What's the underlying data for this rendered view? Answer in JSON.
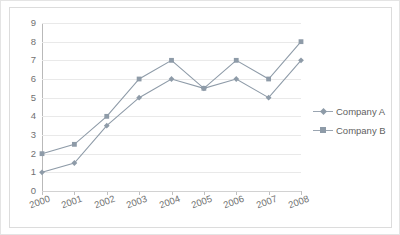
{
  "chart_data": {
    "type": "line",
    "title": "",
    "xlabel": "",
    "ylabel": "",
    "categories": [
      "2000",
      "2001",
      "2002",
      "2003",
      "2004",
      "2005",
      "2006",
      "2007",
      "2008"
    ],
    "series": [
      {
        "name": "Company A",
        "marker": "diamond",
        "values": [
          1,
          1.5,
          3.5,
          5,
          6,
          5.5,
          6,
          5,
          7
        ]
      },
      {
        "name": "Company B",
        "marker": "square",
        "values": [
          2,
          2.5,
          4,
          6,
          7,
          5.5,
          7,
          6,
          8
        ]
      }
    ],
    "ylim": [
      0,
      9
    ],
    "yticks": [
      "0",
      "1",
      "2",
      "3",
      "4",
      "5",
      "6",
      "7",
      "8",
      "9"
    ],
    "grid": true,
    "legend_position": "right",
    "colors": {
      "series_line": "#8e9ba8",
      "gridline": "#e9e9e9",
      "axis": "#b9b9b9",
      "tick_text": "#717171",
      "legend_text": "#5f5f5f",
      "border": "#dcdcdc",
      "background": "#ffffff"
    }
  },
  "legend": {
    "items": [
      {
        "label": "Company A"
      },
      {
        "label": "Company B"
      }
    ]
  }
}
